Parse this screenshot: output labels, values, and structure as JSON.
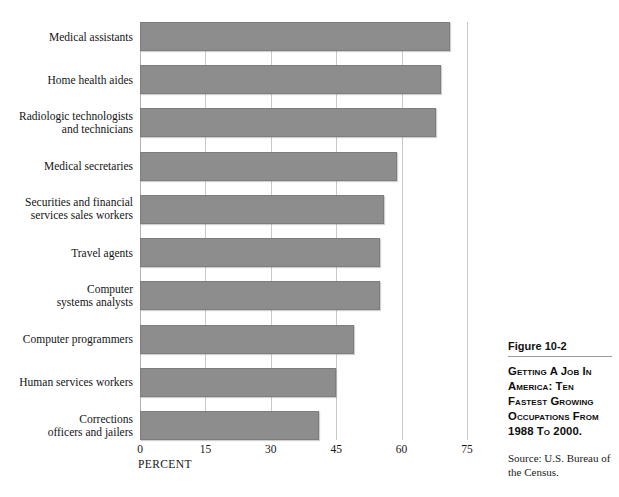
{
  "chart_data": {
    "type": "bar",
    "orientation": "horizontal",
    "title": "Getting a Job in America: Ten Fastest Growing Occupations from 1988 to 2000.",
    "xlabel": "PERCENT",
    "ylabel": "",
    "xlim": [
      0,
      75
    ],
    "xticks": [
      0,
      15,
      30,
      45,
      60,
      75
    ],
    "xtick_labels": [
      "0",
      "15",
      "30",
      "45",
      "60",
      "75"
    ],
    "grid": true,
    "legend": "none",
    "bar_color": "#8d8d8d",
    "categories": [
      "Medical assistants",
      "Home health aides",
      "Radiologic technologists\nand technicians",
      "Medical secretaries",
      "Securities and financial\nservices sales workers",
      "Travel agents",
      "Computer\nsystems analysts",
      "Computer programmers",
      "Human services workers",
      "Corrections\nofficers and jailers"
    ],
    "values": [
      71,
      69,
      68,
      59,
      56,
      55,
      55,
      49,
      45,
      41
    ]
  },
  "caption": {
    "figure_number": "Figure 10-2",
    "title": "Getting A Job In America: Ten Fastest Growing Occupations from 1988 to 2000.",
    "source": "Source: U.S. Bureau of the Census."
  }
}
